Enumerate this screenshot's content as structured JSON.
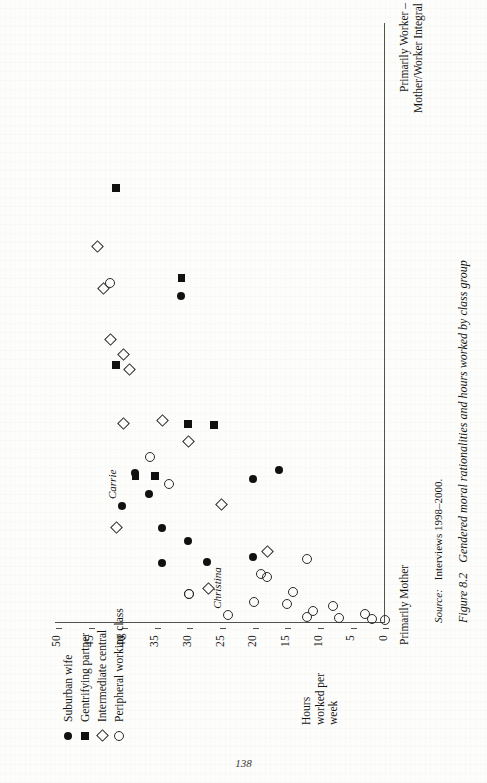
{
  "page": {
    "folio": "138"
  },
  "figure": {
    "caption_number": "Figure 8.2",
    "caption_text": "Gendered moral rationalities and hours worked by class group",
    "source_label": "Source:",
    "source_value": "Interviews 1998–2000."
  },
  "legend": {
    "items": [
      {
        "marker": "filled-circle",
        "label": "Suburban wife",
        "key": "suburban"
      },
      {
        "marker": "filled-square",
        "label": "Gentrifying partner",
        "key": "gentrifying"
      },
      {
        "marker": "open-diamond",
        "label": "Intermediate central",
        "key": "intermediate"
      },
      {
        "marker": "open-circle",
        "label": "Peripheral working class",
        "key": "peripheral"
      }
    ]
  },
  "axes": {
    "y_title": "Hours worked per week",
    "y_ticks": [
      "50",
      "45",
      "40",
      "35",
      "30",
      "25",
      "20",
      "15",
      "10",
      "5",
      "0"
    ],
    "y_min": 0,
    "y_max": 50,
    "x_left_label": "Primarily Mother",
    "x_right_label": "Primarily Worker – Mother/Worker Integral"
  },
  "annotations": [
    {
      "text": "Carrie",
      "key": "carrie"
    },
    {
      "text": "Christina",
      "key": "christina"
    }
  ],
  "chart_data": {
    "type": "scatter",
    "title": "Gendered moral rationalities and hours worked by class group",
    "xlabel": "Moral rationality (Primarily Mother → Primarily Worker – Mother/Worker Integral)",
    "ylabel": "Hours worked per week",
    "ylim": [
      0,
      50
    ],
    "xlim": [
      0,
      1
    ],
    "grid": false,
    "legend_position": "upper-left",
    "x_axis_type": "ordinal-continuum",
    "x_tick_labels": [
      "Primarily Mother",
      "Primarily Worker – Mother/Worker Integral"
    ],
    "y_ticks": [
      50,
      45,
      40,
      35,
      30,
      25,
      20,
      15,
      10,
      5,
      0
    ],
    "series": [
      {
        "name": "Suburban wife",
        "marker": "filled-circle",
        "points": [
          {
            "x": 0.545,
            "y": 31,
            "label": null
          },
          {
            "x": 0.25,
            "y": 38,
            "label": null
          },
          {
            "x": 0.215,
            "y": 36,
            "label": null
          },
          {
            "x": 0.195,
            "y": 40,
            "label": "Carrie"
          },
          {
            "x": 0.1,
            "y": 34,
            "label": null
          },
          {
            "x": 0.102,
            "y": 27,
            "label": null
          },
          {
            "x": 0.158,
            "y": 34,
            "label": null
          },
          {
            "x": 0.137,
            "y": 30,
            "label": null
          },
          {
            "x": 0.11,
            "y": 20,
            "label": null
          },
          {
            "x": 0.24,
            "y": 20,
            "label": null
          },
          {
            "x": 0.255,
            "y": 16,
            "label": null
          }
        ]
      },
      {
        "name": "Gentrifying partner",
        "marker": "filled-square",
        "points": [
          {
            "x": 0.575,
            "y": 31,
            "label": null
          },
          {
            "x": 0.725,
            "y": 41,
            "label": null
          },
          {
            "x": 0.43,
            "y": 41,
            "label": null
          },
          {
            "x": 0.332,
            "y": 30,
            "label": null
          },
          {
            "x": 0.33,
            "y": 26,
            "label": null
          },
          {
            "x": 0.245,
            "y": 38,
            "label": null
          },
          {
            "x": 0.245,
            "y": 35,
            "label": null
          }
        ]
      },
      {
        "name": "Intermediate central",
        "marker": "open-diamond",
        "points": [
          {
            "x": 0.555,
            "y": 43,
            "label": null
          },
          {
            "x": 0.47,
            "y": 42,
            "label": null
          },
          {
            "x": 0.445,
            "y": 40,
            "label": null
          },
          {
            "x": 0.42,
            "y": 39,
            "label": null
          },
          {
            "x": 0.625,
            "y": 44,
            "label": null
          },
          {
            "x": 0.33,
            "y": 40,
            "label": null
          },
          {
            "x": 0.335,
            "y": 34,
            "label": null
          },
          {
            "x": 0.3,
            "y": 30,
            "label": null
          },
          {
            "x": 0.195,
            "y": 25,
            "label": null
          },
          {
            "x": 0.157,
            "y": 41,
            "label": null
          },
          {
            "x": 0.118,
            "y": 18,
            "label": null
          },
          {
            "x": 0.055,
            "y": 27,
            "label": null
          }
        ]
      },
      {
        "name": "Peripheral working class",
        "marker": "open-circle",
        "points": [
          {
            "x": 0.565,
            "y": 42,
            "label": null
          },
          {
            "x": 0.275,
            "y": 36,
            "label": null
          },
          {
            "x": 0.23,
            "y": 33,
            "label": null
          },
          {
            "x": 0.105,
            "y": 12,
            "label": null
          },
          {
            "x": 0.08,
            "y": 19,
            "label": null
          },
          {
            "x": 0.075,
            "y": 18,
            "label": null
          },
          {
            "x": 0.05,
            "y": 14,
            "label": null
          },
          {
            "x": 0.047,
            "y": 30,
            "label": null
          },
          {
            "x": 0.046,
            "y": 30,
            "label": null
          },
          {
            "x": 0.033,
            "y": 20,
            "label": null
          },
          {
            "x": 0.03,
            "y": 15,
            "label": null
          },
          {
            "x": 0.027,
            "y": 8,
            "label": null
          },
          {
            "x": 0.018,
            "y": 11,
            "label": null
          },
          {
            "x": 0.013,
            "y": 3,
            "label": null
          },
          {
            "x": 0.012,
            "y": 24,
            "label": "Christina"
          },
          {
            "x": 0.009,
            "y": 12,
            "label": null
          },
          {
            "x": 0.007,
            "y": 7,
            "label": null
          },
          {
            "x": 0.005,
            "y": 2,
            "label": null
          },
          {
            "x": 0.003,
            "y": 0,
            "label": null
          }
        ]
      }
    ]
  }
}
